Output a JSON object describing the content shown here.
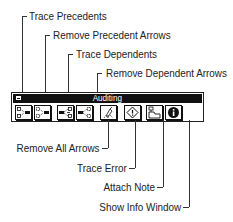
{
  "palette": {
    "title": "Auditing",
    "buttons": [
      {
        "id": "trace-precedents",
        "label": "Trace Precedents",
        "icon": "trace-precedents-icon"
      },
      {
        "id": "remove-precedent-arrows",
        "label": "Remove Precedent Arrows",
        "icon": "remove-precedent-arrows-icon"
      },
      {
        "id": "trace-dependents",
        "label": "Trace Dependents",
        "icon": "trace-dependents-icon"
      },
      {
        "id": "remove-dependent-arrows",
        "label": "Remove Dependent Arrows",
        "icon": "remove-dependent-arrows-icon"
      },
      {
        "id": "remove-all-arrows",
        "label": "Remove All Arrows",
        "icon": "remove-all-arrows-icon"
      },
      {
        "id": "trace-error",
        "label": "Trace Error",
        "icon": "trace-error-icon"
      },
      {
        "id": "attach-note",
        "label": "Attach Note",
        "icon": "attach-note-icon"
      },
      {
        "id": "show-info-window",
        "label": "Show Info Window",
        "icon": "info-icon"
      }
    ]
  },
  "callouts": {
    "top": [
      "Trace Precedents",
      "Remove Precedent Arrows",
      "Trace Dependents",
      "Remove Dependent Arrows"
    ],
    "bottom": [
      "Remove All Arrows",
      "Trace Error",
      "Attach Note",
      "Show Info Window"
    ]
  }
}
